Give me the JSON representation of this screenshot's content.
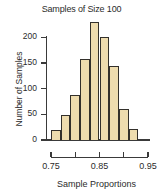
{
  "chart_data": {
    "type": "bar",
    "title": "Samples of Size 100",
    "xlabel": "Sample Proportions",
    "ylabel": "Number of Samples",
    "categories": [
      "0.75",
      "0.77",
      "0.79",
      "0.81",
      "0.83",
      "0.85",
      "0.87",
      "0.89",
      "0.91"
    ],
    "bin_edges": [
      0.75,
      0.77,
      0.79,
      0.81,
      0.83,
      0.85,
      0.87,
      0.89,
      0.91,
      0.93
    ],
    "values": [
      20,
      48,
      88,
      158,
      230,
      200,
      143,
      60,
      22
    ],
    "bin_width": 0.02,
    "xlim": [
      0.75,
      0.95
    ],
    "ylim": [
      0,
      230
    ],
    "x_ticks": [
      0.75,
      0.8,
      0.85,
      0.9,
      0.95
    ],
    "x_tick_labels": [
      "0.75",
      "",
      "0.85",
      "",
      "0.95"
    ],
    "y_ticks": [
      0,
      50,
      100,
      150,
      200
    ],
    "y_tick_labels": [
      "0",
      "50",
      "100",
      "150",
      "200"
    ],
    "grid": false,
    "legend": false,
    "bar_fill_color": "#eedcae",
    "bar_edge_color": "#33302b",
    "axis_color": "#3a3a3a",
    "text_color": "#2b2b2b",
    "background_color": "#ffffff"
  }
}
